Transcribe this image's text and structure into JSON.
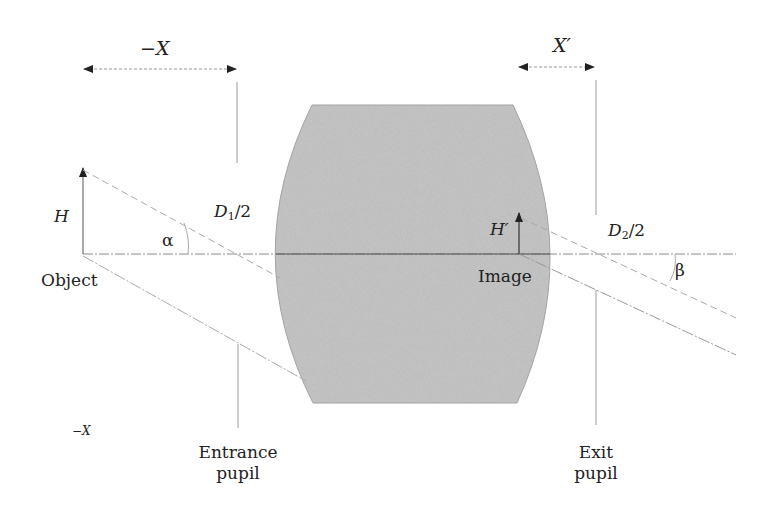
{
  "diagram": {
    "type": "optical-system-pupils",
    "colors": {
      "lens_fill": "#c4c4c4",
      "line": "#9a9a9a",
      "axis": "#888888",
      "text": "#222222",
      "background": "#ffffff"
    },
    "labels": {
      "minus_x_top": "−X",
      "x_prime": "X′",
      "h": "H",
      "alpha": "α",
      "d1": "D",
      "d1_sub": "1",
      "d1_tail": "/2",
      "object": "Object",
      "h_prime": "H′",
      "image": "Image",
      "d2": "D",
      "d2_sub": "2",
      "d2_tail": "/2",
      "beta": "β",
      "minus_x_bottom": "−X",
      "entrance_pupil_line1": "Entrance",
      "entrance_pupil_line2": "pupil",
      "exit_pupil_line1": "Exit",
      "exit_pupil_line2": "pupil"
    },
    "elements": [
      "optical axis",
      "thick lens (biconvex, gray)",
      "object arrow H",
      "image arrow H′",
      "entrance pupil plane",
      "exit pupil plane",
      "chief ray (dashed)",
      "marginal ray (solid)",
      "angle α",
      "angle β",
      "distance −X arrow",
      "distance X′ arrow"
    ]
  }
}
